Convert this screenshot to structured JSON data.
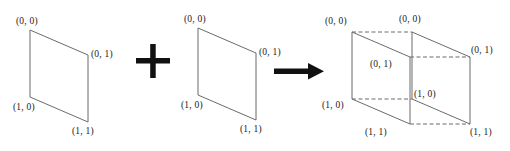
{
  "diagram": {
    "background_color": "#ffffff",
    "line_color": "#6b6b6b",
    "glyph_color": "#111111",
    "label_color": "#1a1a1a",
    "operator_plus": "+",
    "operator_arrow": "→",
    "shapes": [
      {
        "name": "left-parallelogram",
        "type": "parallelogram",
        "points": "30,30 88,55 88,122 30,97",
        "vertex_labels": [
          {
            "text": "(0, 0)",
            "x": 16,
            "y": 17
          },
          {
            "text": "(0, 1)",
            "x": 91,
            "y": 50
          },
          {
            "text": "(1, 0)",
            "x": 13,
            "y": 103
          },
          {
            "text": "(1, 1)",
            "x": 72,
            "y": 127
          }
        ]
      },
      {
        "name": "middle-parallelogram",
        "type": "parallelogram",
        "points": "198,28 256,53 256,120 198,95",
        "vertex_labels": [
          {
            "text": "(0, 0)",
            "x": 184,
            "y": 15
          },
          {
            "text": "(0, 1)",
            "x": 259,
            "y": 48
          },
          {
            "text": "(1, 0)",
            "x": 181,
            "y": 101
          },
          {
            "text": "(1, 1)",
            "x": 240,
            "y": 125
          }
        ]
      },
      {
        "name": "result-box",
        "type": "rectangular-prism",
        "front_face": "352,32 410,57 410,124 352,99",
        "back_face": "412,32 470,57 470,124 412,99",
        "vertex_labels": [
          {
            "text": "(0, 0)",
            "x": 325,
            "y": 17
          },
          {
            "text": "(0, 0)",
            "x": 399,
            "y": 15
          },
          {
            "text": "(0, 1)",
            "x": 370,
            "y": 60
          },
          {
            "text": "(0, 1)",
            "x": 471,
            "y": 46
          },
          {
            "text": "(1, 0)",
            "x": 322,
            "y": 101
          },
          {
            "text": "(1, 0)",
            "x": 414,
            "y": 90
          },
          {
            "text": "(1, 1)",
            "x": 365,
            "y": 128
          },
          {
            "text": "(1, 1)",
            "x": 470,
            "y": 128
          }
        ]
      }
    ],
    "operators": [
      {
        "name": "plus-operator",
        "symbol": "+",
        "x": 136,
        "y": 47,
        "size": 34
      },
      {
        "name": "arrow-operator",
        "symbol": "→",
        "x": 274,
        "y": 60,
        "length": 48
      }
    ]
  }
}
